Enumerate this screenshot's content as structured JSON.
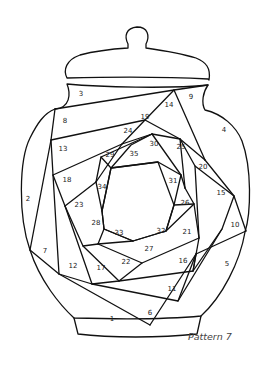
{
  "caption": "Pattern 7",
  "colors": {
    "line": "#111111",
    "background": "#ffffff",
    "text": "#222222"
  },
  "labels": [
    {
      "n": "1",
      "x": 112,
      "y": 319
    },
    {
      "n": "2",
      "x": 28,
      "y": 199
    },
    {
      "n": "3",
      "x": 81,
      "y": 94
    },
    {
      "n": "4",
      "x": 224,
      "y": 130
    },
    {
      "n": "5",
      "x": 227,
      "y": 264
    },
    {
      "n": "6",
      "x": 150,
      "y": 313
    },
    {
      "n": "7",
      "x": 45,
      "y": 251
    },
    {
      "n": "8",
      "x": 65,
      "y": 121
    },
    {
      "n": "9",
      "x": 191,
      "y": 97
    },
    {
      "n": "10",
      "x": 235,
      "y": 225
    },
    {
      "n": "11",
      "x": 172,
      "y": 289
    },
    {
      "n": "12",
      "x": 73,
      "y": 266
    },
    {
      "n": "13",
      "x": 63,
      "y": 149
    },
    {
      "n": "14",
      "x": 169,
      "y": 105
    },
    {
      "n": "15",
      "x": 221,
      "y": 193
    },
    {
      "n": "16",
      "x": 183,
      "y": 261
    },
    {
      "n": "17",
      "x": 101,
      "y": 268
    },
    {
      "n": "18",
      "x": 67,
      "y": 180
    },
    {
      "n": "19",
      "x": 145,
      "y": 117
    },
    {
      "n": "20",
      "x": 203,
      "y": 167
    },
    {
      "n": "21",
      "x": 187,
      "y": 232
    },
    {
      "n": "22",
      "x": 126,
      "y": 262
    },
    {
      "n": "23",
      "x": 79,
      "y": 205
    },
    {
      "n": "24",
      "x": 128,
      "y": 131
    },
    {
      "n": "25",
      "x": 181,
      "y": 147
    },
    {
      "n": "26",
      "x": 185,
      "y": 203
    },
    {
      "n": "27",
      "x": 149,
      "y": 249
    },
    {
      "n": "28",
      "x": 96,
      "y": 223
    },
    {
      "n": "29",
      "x": 110,
      "y": 155
    },
    {
      "n": "30",
      "x": 154,
      "y": 144
    },
    {
      "n": "31",
      "x": 173,
      "y": 181
    },
    {
      "n": "32",
      "x": 161,
      "y": 231
    },
    {
      "n": "33",
      "x": 119,
      "y": 233
    },
    {
      "n": "34",
      "x": 102,
      "y": 187
    },
    {
      "n": "35",
      "x": 134,
      "y": 154
    }
  ]
}
